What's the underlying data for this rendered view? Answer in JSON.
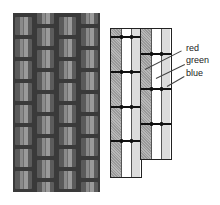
{
  "figure": {
    "photo_caption": "",
    "labels": {
      "red": "red",
      "green": "green",
      "blue": "blue"
    },
    "colors": {
      "red_stripe": "#a8a8a8",
      "green_stripe": "#ffffff",
      "blue_stripe": "#dcdcdc",
      "outline": "#222222",
      "photo_bg": "#3a3a3a"
    }
  }
}
